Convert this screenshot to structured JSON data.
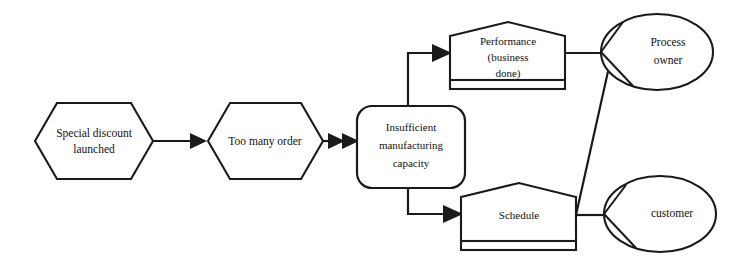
{
  "diagram": {
    "background_color": "#ffffff",
    "line_color": "#1a1a1a",
    "nodes": [
      {
        "id": "special-discount-launched",
        "label_lines": [
          "Special discount",
          "launched"
        ],
        "shape": "hexagon",
        "x": 35,
        "y": 103,
        "w": 118,
        "h": 76
      },
      {
        "id": "too-many-order",
        "label_lines": [
          "Too many order"
        ],
        "shape": "hexagon",
        "x": 208,
        "y": 103,
        "w": 115,
        "h": 76
      },
      {
        "id": "insufficient-manufacturing-capacity",
        "label_lines": [
          "Insufficient",
          "manufacturing",
          "capacity"
        ],
        "shape": "rounded-rectangle",
        "x": 357,
        "y": 106,
        "w": 108,
        "h": 82
      },
      {
        "id": "performance-business-done",
        "label_lines": [
          "Performance",
          "(business",
          "done)"
        ],
        "shape": "house",
        "x": 450,
        "y": 22,
        "w": 115,
        "h": 68
      },
      {
        "id": "schedule",
        "label_lines": [
          "Schedule"
        ],
        "shape": "house",
        "x": 461,
        "y": 183,
        "w": 115,
        "h": 68
      },
      {
        "id": "process-owner",
        "label_lines": [
          "Process",
          "owner"
        ],
        "shape": "ellipse-wedge",
        "cx": 657,
        "cy": 52,
        "rx": 56,
        "ry": 38
      },
      {
        "id": "customer",
        "label_lines": [
          "customer"
        ],
        "shape": "ellipse-wedge",
        "cx": 660,
        "cy": 214,
        "rx": 56,
        "ry": 38
      }
    ],
    "connectors": [
      {
        "id": "discount-to-orders",
        "from": "special-discount-launched",
        "to": "too-many-order",
        "arrowheads": 1
      },
      {
        "id": "orders-to-capacity",
        "from": "too-many-order",
        "to": "insufficient-manufacturing-capacity",
        "arrowheads": 2
      },
      {
        "id": "capacity-to-performance",
        "from": "insufficient-manufacturing-capacity",
        "to": "performance-business-done",
        "arrowheads": 1
      },
      {
        "id": "capacity-to-schedule",
        "from": "insufficient-manufacturing-capacity",
        "to": "schedule",
        "arrowheads": 1
      },
      {
        "id": "performance-to-process-owner",
        "from": "performance-business-done",
        "to": "process-owner",
        "arrowheads": 0
      },
      {
        "id": "schedule-to-customer",
        "from": "schedule",
        "to": "customer",
        "arrowheads": 0
      },
      {
        "id": "schedule-to-process-owner",
        "from": "schedule",
        "to": "process-owner",
        "arrowheads": 0
      }
    ]
  }
}
